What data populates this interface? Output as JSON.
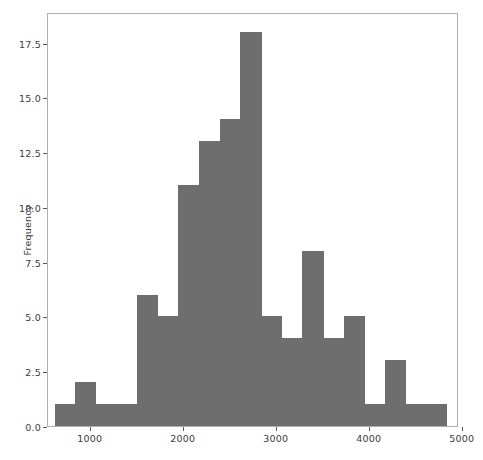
{
  "chart_data": {
    "type": "bar",
    "title": "",
    "xlabel": "",
    "ylabel": "Frequency",
    "xlim": [
      540,
      4960
    ],
    "ylim": [
      0,
      18.9
    ],
    "grid": false,
    "legend": null,
    "bar_color": "#6e6e6e",
    "xticks": [
      1000,
      2000,
      3000,
      4000,
      5000
    ],
    "xticklabels": [
      "1000",
      "2000",
      "3000",
      "4000",
      "5000"
    ],
    "yticks": [
      0.0,
      2.5,
      5.0,
      7.5,
      10.0,
      12.5,
      15.0,
      17.5
    ],
    "yticklabels": [
      "0.0",
      "2.5",
      "5.0",
      "7.5",
      "10.0",
      "12.5",
      "15.0",
      "17.5"
    ],
    "bin_edges": [
      611,
      833,
      1055,
      1277,
      1499,
      1721,
      1943,
      2043,
      2143,
      2243,
      2343,
      2565,
      2787,
      3009,
      3231,
      3453,
      3675,
      3897,
      4119,
      4341,
      4563,
      4830
    ],
    "bins": [
      {
        "left": 611,
        "right": 833,
        "count": 1
      },
      {
        "left": 833,
        "right": 1055,
        "count": 2
      },
      {
        "left": 1055,
        "right": 1277,
        "count": 1
      },
      {
        "left": 1277,
        "right": 1499,
        "count": 1
      },
      {
        "left": 1499,
        "right": 1721,
        "count": 6
      },
      {
        "left": 1721,
        "right": 1943,
        "count": 5
      },
      {
        "left": 1943,
        "right": 2165,
        "count": 11
      },
      {
        "left": 2165,
        "right": 2387,
        "count": 13
      },
      {
        "left": 2387,
        "right": 2609,
        "count": 14
      },
      {
        "left": 2609,
        "right": 2831,
        "count": 18
      },
      {
        "left": 2831,
        "right": 3053,
        "count": 5
      },
      {
        "left": 3053,
        "right": 3275,
        "count": 4
      },
      {
        "left": 3275,
        "right": 3497,
        "count": 8
      },
      {
        "left": 3497,
        "right": 3719,
        "count": 4
      },
      {
        "left": 3719,
        "right": 3941,
        "count": 5
      },
      {
        "left": 3941,
        "right": 4163,
        "count": 1
      },
      {
        "left": 4163,
        "right": 4385,
        "count": 3
      },
      {
        "left": 4385,
        "right": 4607,
        "count": 1
      },
      {
        "left": 4607,
        "right": 4829,
        "count": 1
      }
    ],
    "categories": [
      "611-833",
      "833-1055",
      "1055-1277",
      "1277-1499",
      "1499-1721",
      "1721-1943",
      "1943-2165",
      "2165-2387",
      "2387-2609",
      "2609-2831",
      "2831-3053",
      "3053-3275",
      "3275-3497",
      "3497-3719",
      "3719-3941",
      "3941-4163",
      "4163-4385",
      "4385-4607",
      "4607-4829"
    ],
    "values": [
      1,
      2,
      1,
      1,
      6,
      5,
      11,
      13,
      14,
      18,
      5,
      4,
      8,
      4,
      5,
      1,
      3,
      1,
      1
    ]
  }
}
